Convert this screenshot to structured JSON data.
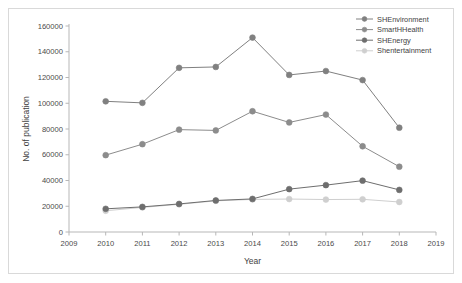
{
  "chart_data": {
    "type": "line",
    "title": "",
    "xlabel": "Year",
    "ylabel": "No. of publication",
    "x": [
      2010,
      2011,
      2012,
      2013,
      2014,
      2015,
      2016,
      2017,
      2018
    ],
    "xtick_labels": [
      "2009",
      "2010",
      "2011",
      "2012",
      "2013",
      "2014",
      "2015",
      "2016",
      "2017",
      "2018",
      "2019"
    ],
    "xlim": [
      2009,
      2019
    ],
    "ytick_labels": [
      "0",
      "20000",
      "40000",
      "60000",
      "80000",
      "100000",
      "120000",
      "140000",
      "160000"
    ],
    "ylim": [
      0,
      160000
    ],
    "ytick_step": 20000,
    "grid": false,
    "legend_position": "top-right",
    "marker": "circle",
    "series": [
      {
        "name": "SHEnvironment",
        "color": "#808080",
        "values": [
          101500,
          100300,
          127500,
          128200,
          151000,
          122000,
          125000,
          118000,
          81000
        ]
      },
      {
        "name": "SmartHHealth",
        "color": "#8c8c8c",
        "values": [
          59700,
          68200,
          79500,
          78900,
          93800,
          85100,
          91200,
          66600,
          50700
        ]
      },
      {
        "name": "SHEnergy",
        "color": "#6e6e6e",
        "values": [
          18000,
          19500,
          21800,
          24500,
          25700,
          33300,
          36400,
          39900,
          32700
        ]
      },
      {
        "name": "Shentertainment",
        "color": "#cfcfcf",
        "values": [
          16500,
          19100,
          21500,
          24200,
          25300,
          25600,
          25200,
          25400,
          23300
        ]
      }
    ]
  },
  "colors": {
    "axis": "#b7b7b7",
    "frame": "#d9d9d9",
    "text": "#3f3f3f",
    "background": "#ffffff"
  }
}
